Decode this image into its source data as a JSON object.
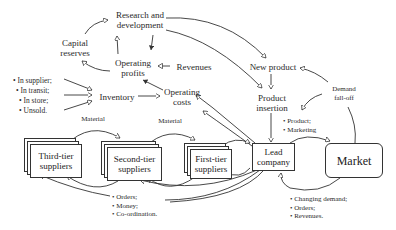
{
  "nodes": {
    "research": "Research and development",
    "research_l1": "Research and",
    "research_l2": "development",
    "capital_l1": "Capital",
    "capital_l2": "reserves",
    "profits_l1": "Operating",
    "profits_l2": "profits",
    "revenues": "Revenues",
    "new_product": "New product",
    "demand_l1": "Demand",
    "demand_l2": "fall-off",
    "inventory": "Inventory",
    "costs_l1": "Operating",
    "costs_l2": "costs",
    "insertion_l1": "Product",
    "insertion_l2": "insertion",
    "third_l1": "Third-tier",
    "third_l2": "suppliers",
    "second_l1": "Second-tier",
    "second_l2": "suppliers",
    "first_l1": "First-tier",
    "first_l2": "suppliers",
    "lead_l1": "Lead",
    "lead_l2": "company",
    "market": "Market"
  },
  "inventory_items": [
    "• In supplier;",
    "• In transit;",
    "• In store;",
    "• Unsold."
  ],
  "flow_labels": {
    "material_1": "Material",
    "material_2": "Material"
  },
  "product_marketing": [
    "• Product;",
    "• Marketing"
  ],
  "orders_money": [
    "• Orders;",
    "• Money;",
    "• Co-ordination."
  ],
  "market_feedback": [
    "• Changing demand;",
    "• Orders;",
    "• Revenues."
  ]
}
